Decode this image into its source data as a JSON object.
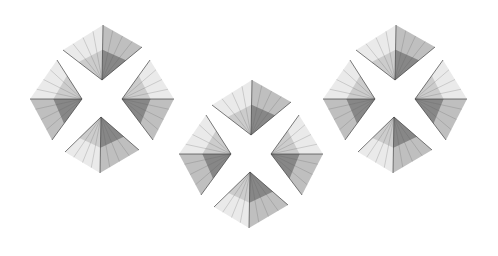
{
  "image": {
    "description": "Three clusters of four folded, origami-like grayscale petals arranged in cross/diamond patterns on a white background",
    "width": 498,
    "height": 256,
    "background": "#ffffff",
    "palette": {
      "light": "#e6e6e6",
      "mid": "#b4b4b4",
      "dark": "#5a5a5a",
      "crease": "#3c3c3c"
    }
  },
  "clusters": [
    {
      "name": "cluster-left",
      "dx": 0,
      "dy": 0
    },
    {
      "name": "cluster-middle",
      "dx": 149,
      "dy": 55
    },
    {
      "name": "cluster-right",
      "dx": 293,
      "dy": 0
    }
  ],
  "petals": [
    {
      "name": "top-petal",
      "tip": [
        103,
        25
      ],
      "wing1": [
        63,
        50
      ],
      "wing2": [
        142,
        47
      ],
      "base": [
        102,
        80
      ]
    },
    {
      "name": "left-petal",
      "tip": [
        30,
        99
      ],
      "wing1": [
        57,
        60
      ],
      "wing2": [
        52,
        140
      ],
      "base": [
        82,
        99
      ]
    },
    {
      "name": "right-petal",
      "tip": [
        174,
        99
      ],
      "wing1": [
        150,
        60
      ],
      "wing2": [
        153,
        140
      ],
      "base": [
        122,
        99
      ]
    },
    {
      "name": "bottom-petal",
      "tip": [
        100,
        173
      ],
      "wing1": [
        65,
        152
      ],
      "wing2": [
        139,
        150
      ],
      "base": [
        101,
        117
      ]
    }
  ]
}
